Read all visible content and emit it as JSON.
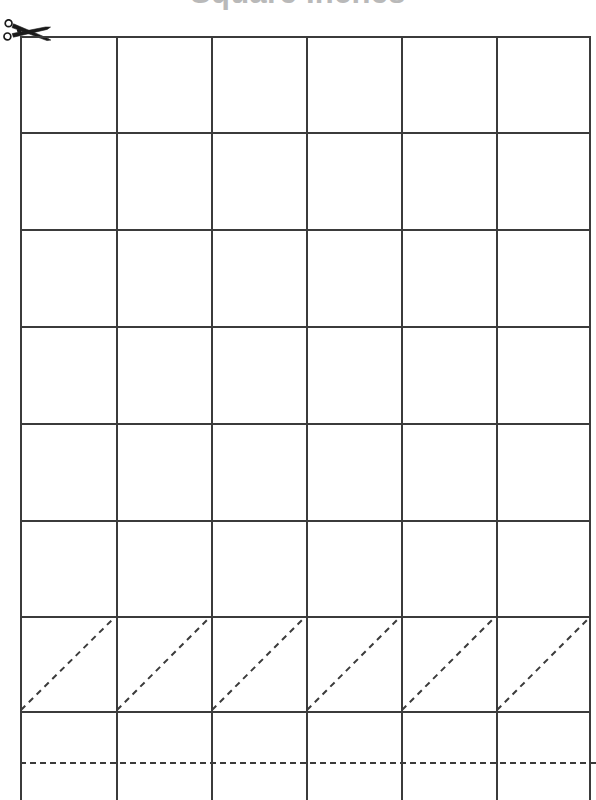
{
  "page": {
    "title": "Square Inches",
    "title_color": "#b9b9b9",
    "background_color": "#ffffff",
    "width": 596,
    "height": 800
  },
  "icons": {
    "scissors": {
      "name": "scissors-icon",
      "label": "Cut along the line",
      "color": "#1a1a1a",
      "x": 3,
      "y": 19
    }
  },
  "grid": {
    "line_color": "#3b3b3b",
    "line_width": 2,
    "left": 20,
    "right": 591,
    "columns": 6,
    "column_width": 95.2,
    "vertical_lines_x": [
      20,
      116,
      211,
      306,
      401,
      496,
      591
    ],
    "horizontal_lines_y": [
      36,
      132,
      229,
      326,
      423,
      520,
      616,
      711
    ],
    "rows_visible": 7,
    "row_height": 96,
    "partial_row_top": 711,
    "diagonal_row": {
      "index": 7,
      "top": 616,
      "bottom": 711,
      "direction": "bottom-left-to-top-right",
      "stroke_style": "dashed",
      "stroke_color": "#3b3b3b",
      "cells": 6
    },
    "cut_line": {
      "y": 762,
      "stroke_style": "dashed",
      "stroke_color": "#3b3b3b",
      "stroke_width": 2
    }
  },
  "cells": {
    "values": [
      "",
      "",
      "",
      "",
      "",
      "",
      "",
      "",
      "",
      "",
      "",
      "",
      "",
      "",
      "",
      "",
      "",
      "",
      "",
      "",
      "",
      "",
      "",
      "",
      "",
      "",
      "",
      "",
      "",
      "",
      "",
      "",
      "",
      "",
      "",
      "",
      "",
      "",
      "",
      "",
      "",
      ""
    ]
  }
}
